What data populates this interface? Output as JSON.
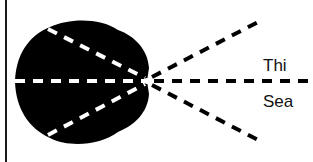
{
  "diagram": {
    "labels": {
      "upper": "Thi",
      "lower": "Sea"
    },
    "colors": {
      "shape_fill": "#000000",
      "inner_dash": "#ffffff",
      "outer_dash": "#000000",
      "background": "#ffffff",
      "border": "#1a1a1a"
    },
    "elements": {
      "shape": "black-rounded-blob",
      "rays": [
        "upper-diagonal",
        "horizontal",
        "lower-diagonal"
      ],
      "convergence_point": [
        147,
        81
      ]
    }
  }
}
